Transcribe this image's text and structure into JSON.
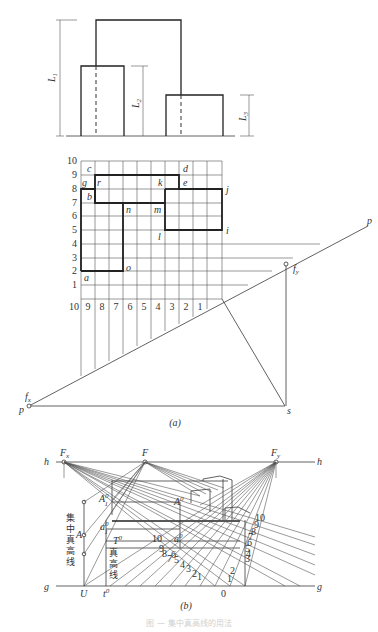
{
  "figure_a": {
    "elevation": {
      "dims": {
        "L1": "L",
        "L1_sub": "1",
        "L2": "L",
        "L2_sub": "2",
        "L3": "L",
        "L3_sub": "3"
      }
    },
    "plan_grid": {
      "row_labels": [
        "1",
        "2",
        "3",
        "4",
        "5",
        "6",
        "7",
        "8",
        "9",
        "10"
      ],
      "col_labels": [
        "10",
        "9",
        "8",
        "7",
        "6",
        "5",
        "4",
        "3",
        "2",
        "1"
      ],
      "point_labels": {
        "a": "a",
        "b": "b",
        "c": "c",
        "d": "d",
        "e": "e",
        "g": "g",
        "i": "i",
        "j": "j",
        "k": "k",
        "l": "l",
        "m": "m",
        "n": "n",
        "o": "o",
        "r": "r"
      }
    },
    "picture_plane": {
      "p_left": "p",
      "p_right": "p",
      "fx": "f",
      "fx_sub": "x",
      "fy": "f",
      "fy_sub": "y",
      "s": "s"
    },
    "caption": "(a)"
  },
  "figure_b": {
    "horizon": {
      "h_left": "h",
      "h_right": "h",
      "Fx": "F",
      "Fx_sub": "x",
      "F": "F",
      "Fy": "F",
      "Fy_sub": "y"
    },
    "ground": {
      "g_left": "g",
      "g_right": "g",
      "U": "U",
      "t0": "t",
      "t0_sup": "0",
      "zero": "0"
    },
    "labels": {
      "A": "A",
      "A1_0": "A",
      "A1_0_sub": "1",
      "A1_0_sup": "0",
      "A0": "A",
      "A0_sup": "0",
      "a1_0": "a",
      "a1_0_sub": "1",
      "a1_0_sup": "0",
      "a0": "a",
      "a0_sup": "0",
      "T0": "T",
      "T0_sup": "0",
      "concentrated_true_height_line": [
        "集",
        "中",
        "真",
        "高",
        "线"
      ],
      "true_height_line": [
        "真",
        "高",
        "线"
      ]
    },
    "left_scale": [
      "10",
      "9",
      "8",
      "7",
      "6",
      "5",
      "4",
      "3",
      "2",
      "1"
    ],
    "right_scale": [
      "10",
      "9",
      "8",
      "7",
      "6",
      "5",
      "4",
      "3",
      "2",
      "1"
    ],
    "caption": "(b)"
  },
  "figure_caption": "图 — 集中真高线的用法"
}
